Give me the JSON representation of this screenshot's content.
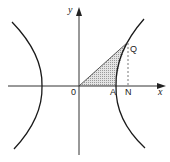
{
  "diagram": {
    "type": "hyperbola",
    "colors": {
      "background": "#ffffff",
      "curve": "#1a1a1a",
      "axis": "#333333",
      "shade": "#c8c8c8",
      "dashed": "#555555"
    },
    "axes": {
      "x_label": "x",
      "y_label": "y"
    },
    "points": {
      "origin": "0",
      "vertex": "A",
      "foot": "N",
      "point": "Q"
    }
  }
}
